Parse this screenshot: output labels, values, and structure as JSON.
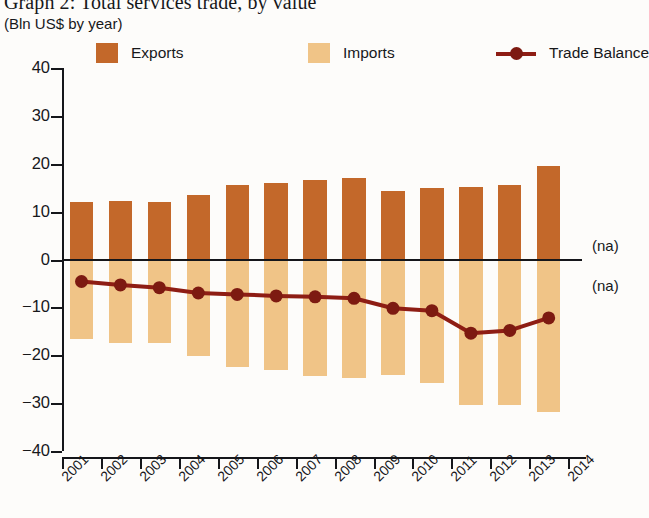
{
  "header": {
    "title": "Graph 2: Total services trade, by value",
    "subtitle": "(Bln US$ by year)"
  },
  "legend": {
    "items": [
      {
        "label": "Exports",
        "type": "swatch",
        "color": "#c3682a"
      },
      {
        "label": "Imports",
        "type": "swatch",
        "color": "#f0c487"
      },
      {
        "label": "Trade Balance",
        "type": "line",
        "color": "#8e1d14"
      }
    ]
  },
  "annotations": [
    {
      "label": "(na)",
      "x": 592,
      "y": 237
    },
    {
      "label": "(na)",
      "x": 592,
      "y": 277
    }
  ],
  "chart_data": {
    "type": "bar",
    "title": "Graph 2: Total services trade, by value",
    "subtitle": "(Bln US$ by year)",
    "xlabel": "",
    "ylabel": "Bln US$ by year",
    "ylim": [
      -40,
      40
    ],
    "yticks": [
      40,
      30,
      20,
      10,
      0,
      -10,
      -20,
      -30,
      -40
    ],
    "ytick_labels": [
      "40",
      "30",
      "20",
      "10",
      "0",
      "−10",
      "−20",
      "−30",
      "−40"
    ],
    "xticks": [
      "2001",
      "2002",
      "2003",
      "2004",
      "2005",
      "2006",
      "2007",
      "2008",
      "2009",
      "2010",
      "2011",
      "2012",
      "2013",
      "2014"
    ],
    "categories": [
      "2001",
      "2002",
      "2003",
      "2004",
      "2005",
      "2006",
      "2007",
      "2008",
      "2009",
      "2010",
      "2011",
      "2012",
      "2013"
    ],
    "grid": false,
    "legend_position": "top",
    "series": [
      {
        "name": "Exports",
        "type": "bar",
        "color": "#c3682a",
        "values": [
          12.1,
          12.3,
          12.1,
          13.4,
          15.5,
          15.9,
          16.7,
          17.1,
          14.4,
          14.9,
          15.1,
          15.5,
          19.6
        ]
      },
      {
        "name": "Imports",
        "type": "bar",
        "color": "#f0c487",
        "values": [
          -16.7,
          -17.5,
          -17.4,
          -20.2,
          -22.5,
          -23.1,
          -24.4,
          -24.7,
          -24.2,
          -25.9,
          -30.4,
          -30.3,
          -31.8
        ]
      },
      {
        "name": "Trade Balance",
        "type": "line",
        "color": "#8e1d14",
        "values": [
          -4.6,
          -5.3,
          -5.9,
          -7.0,
          -7.3,
          -7.6,
          -7.8,
          -8.1,
          -10.2,
          -10.7,
          -15.4,
          -14.8,
          -12.2
        ]
      }
    ]
  }
}
